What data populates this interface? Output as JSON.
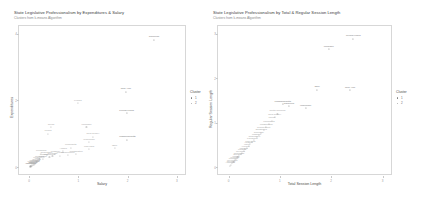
{
  "charts": [
    {
      "title": "State Legislative Professionalism by Expenditures & Salary",
      "subtitle": "Clusters from k-means Algorithm",
      "xlabel": "Salary",
      "ylabel": "Expenditures",
      "legend_title": "Cluster",
      "legend_items": [
        {
          "label": "1",
          "color": "#7b7b7b"
        },
        {
          "label": "2",
          "color": "#a8a8a8"
        }
      ],
      "xticks": [
        "0",
        "1",
        "2",
        "3"
      ],
      "yticks": [
        "0",
        "2",
        "4"
      ],
      "points": [
        {
          "label": "California",
          "x": 0.845,
          "y": 0.955,
          "c": 1
        },
        {
          "label": "New York",
          "x": 0.655,
          "y": 0.565,
          "c": 1
        },
        {
          "label": "Pennsylvania",
          "x": 0.66,
          "y": 0.405,
          "c": 1
        },
        {
          "label": "Massachusetts",
          "x": 0.665,
          "y": 0.205,
          "c": 1
        },
        {
          "label": "Florida",
          "x": 0.33,
          "y": 0.48,
          "c": 2
        },
        {
          "label": "Texas",
          "x": 0.148,
          "y": 0.3,
          "c": 2
        },
        {
          "label": "Illinois",
          "x": 0.128,
          "y": 0.25,
          "c": 2
        },
        {
          "label": "Michigan",
          "x": 0.388,
          "y": 0.3,
          "c": 2
        },
        {
          "label": "New Jersey",
          "x": 0.432,
          "y": 0.228,
          "c": 2
        },
        {
          "label": "Wisconsin",
          "x": 0.405,
          "y": 0.185,
          "c": 2
        },
        {
          "label": "Maryland",
          "x": 0.405,
          "y": 0.132,
          "c": 2
        },
        {
          "label": "Ohio",
          "x": 0.578,
          "y": 0.14,
          "c": 2
        },
        {
          "label": "Minnesota",
          "x": 0.282,
          "y": 0.145,
          "c": 2
        },
        {
          "label": "Alaska",
          "x": 0.23,
          "y": 0.118,
          "c": 2
        },
        {
          "label": "Washington",
          "x": 0.318,
          "y": 0.098,
          "c": 2
        },
        {
          "label": "Connecticut",
          "x": 0.262,
          "y": 0.09,
          "c": 2
        },
        {
          "label": "Arizona",
          "x": 0.208,
          "y": 0.085,
          "c": 2
        },
        {
          "label": "Missouri",
          "x": 0.178,
          "y": 0.098,
          "c": 2
        },
        {
          "label": "Colorado",
          "x": 0.158,
          "y": 0.08,
          "c": 2
        },
        {
          "label": "Oklahoma",
          "x": 0.138,
          "y": 0.072,
          "c": 2
        },
        {
          "label": "Tennessee",
          "x": 0.118,
          "y": 0.092,
          "c": 2
        },
        {
          "label": "Virginia",
          "x": 0.1,
          "y": 0.075,
          "c": 2
        },
        {
          "label": "Indiana",
          "x": 0.092,
          "y": 0.062,
          "c": 2
        },
        {
          "label": "Louisiana",
          "x": 0.082,
          "y": 0.1,
          "c": 2
        },
        {
          "label": "Georgia",
          "x": 0.07,
          "y": 0.058,
          "c": 2
        },
        {
          "label": "Kentucky",
          "x": 0.062,
          "y": 0.048,
          "c": 2
        },
        {
          "label": "Iowa",
          "x": 0.056,
          "y": 0.04,
          "c": 2
        },
        {
          "label": "Oregon",
          "x": 0.05,
          "y": 0.035,
          "c": 2
        },
        {
          "label": "Kansas",
          "x": 0.044,
          "y": 0.03,
          "c": 2
        },
        {
          "label": "Nebraska",
          "x": 0.038,
          "y": 0.026,
          "c": 2
        },
        {
          "label": "Arkansas",
          "x": 0.034,
          "y": 0.022,
          "c": 2
        },
        {
          "label": "Mississippi",
          "x": 0.03,
          "y": 0.018,
          "c": 2
        },
        {
          "label": "Nevada",
          "x": 0.026,
          "y": 0.015,
          "c": 2
        },
        {
          "label": "Idaho",
          "x": 0.022,
          "y": 0.012,
          "c": 2
        },
        {
          "label": "Maine",
          "x": 0.018,
          "y": 0.01,
          "c": 2
        },
        {
          "label": "Montana",
          "x": 0.015,
          "y": 0.008,
          "c": 2
        },
        {
          "label": "Vermont",
          "x": 0.012,
          "y": 0.006,
          "c": 2
        },
        {
          "label": "Wyoming",
          "x": 0.009,
          "y": 0.004,
          "c": 2
        }
      ]
    },
    {
      "title": "State Legislative Professionalism by Total & Regular Session Length",
      "subtitle": "Clusters from k-means Algorithm",
      "xlabel": "Total Session Length",
      "ylabel": "Regular Session Length",
      "legend_title": "Cluster",
      "legend_items": [
        {
          "label": "1",
          "color": "#7b7b7b"
        },
        {
          "label": "2",
          "color": "#a8a8a8"
        }
      ],
      "xticks": [
        "0",
        "1",
        "2",
        "3"
      ],
      "yticks": [
        "0",
        "1",
        "2",
        "3"
      ],
      "points": [
        {
          "label": "Pennsylvania",
          "x": 0.81,
          "y": 0.962,
          "c": 1
        },
        {
          "label": "Michigan",
          "x": 0.65,
          "y": 0.882,
          "c": 1
        },
        {
          "label": "New York",
          "x": 0.79,
          "y": 0.578,
          "c": 1
        },
        {
          "label": "Ohio",
          "x": 0.575,
          "y": 0.58,
          "c": 1
        },
        {
          "label": "Wisconsin",
          "x": 0.5,
          "y": 0.44,
          "c": 1
        },
        {
          "label": "California",
          "x": 0.392,
          "y": 0.455,
          "c": 1
        },
        {
          "label": "Massachusetts",
          "x": 0.352,
          "y": 0.47,
          "c": 1
        },
        {
          "label": "North Carolina",
          "x": 0.318,
          "y": 0.4,
          "c": 2
        },
        {
          "label": "New Jersey",
          "x": 0.3,
          "y": 0.372,
          "c": 2
        },
        {
          "label": "Illinois",
          "x": 0.282,
          "y": 0.348,
          "c": 2
        },
        {
          "label": "Minnesota",
          "x": 0.262,
          "y": 0.322,
          "c": 2
        },
        {
          "label": "Washington",
          "x": 0.245,
          "y": 0.3,
          "c": 2
        },
        {
          "label": "Connecticut",
          "x": 0.228,
          "y": 0.278,
          "c": 2
        },
        {
          "label": "Oklahoma",
          "x": 0.212,
          "y": 0.258,
          "c": 2
        },
        {
          "label": "Colorado",
          "x": 0.196,
          "y": 0.24,
          "c": 2
        },
        {
          "label": "Missouri",
          "x": 0.182,
          "y": 0.222,
          "c": 2
        },
        {
          "label": "Tennessee",
          "x": 0.168,
          "y": 0.205,
          "c": 2
        },
        {
          "label": "Louisiana",
          "x": 0.155,
          "y": 0.19,
          "c": 2
        },
        {
          "label": "Maryland",
          "x": 0.142,
          "y": 0.174,
          "c": 2
        },
        {
          "label": "Virginia",
          "x": 0.13,
          "y": 0.16,
          "c": 2
        },
        {
          "label": "Iowa",
          "x": 0.118,
          "y": 0.146,
          "c": 2
        },
        {
          "label": "Arizona",
          "x": 0.108,
          "y": 0.132,
          "c": 2
        },
        {
          "label": "Indiana",
          "x": 0.098,
          "y": 0.12,
          "c": 2
        },
        {
          "label": "Kansas",
          "x": 0.088,
          "y": 0.108,
          "c": 2
        },
        {
          "label": "Georgia",
          "x": 0.078,
          "y": 0.096,
          "c": 2
        },
        {
          "label": "Nebraska",
          "x": 0.068,
          "y": 0.084,
          "c": 2
        },
        {
          "label": "Oregon",
          "x": 0.058,
          "y": 0.072,
          "c": 2
        },
        {
          "label": "Maine",
          "x": 0.048,
          "y": 0.06,
          "c": 2
        },
        {
          "label": "Vermont",
          "x": 0.04,
          "y": 0.05,
          "c": 2
        },
        {
          "label": "Montana",
          "x": 0.032,
          "y": 0.04,
          "c": 2
        },
        {
          "label": "Wyoming",
          "x": 0.024,
          "y": 0.03,
          "c": 2
        },
        {
          "label": "Nevada",
          "x": 0.016,
          "y": 0.018,
          "c": 2
        },
        {
          "label": "Alabama",
          "x": 0.01,
          "y": 0.01,
          "c": 2
        }
      ]
    }
  ]
}
